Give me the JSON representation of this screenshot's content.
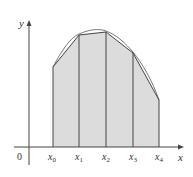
{
  "figure": {
    "axis_labels": {
      "x": "x",
      "y": "y",
      "origin": "0"
    },
    "ticks": [
      {
        "base": "x",
        "sub": "0"
      },
      {
        "base": "x",
        "sub": "1"
      },
      {
        "base": "x",
        "sub": "2"
      },
      {
        "base": "x",
        "sub": "3"
      },
      {
        "base": "x",
        "sub": "4"
      }
    ],
    "colors": {
      "fill": "#dcdcdc",
      "line": "#444444",
      "curve": "#555555"
    }
  }
}
